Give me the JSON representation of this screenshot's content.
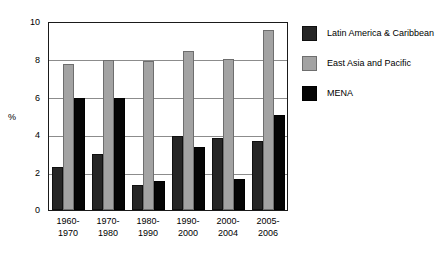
{
  "chart_data": {
    "type": "bar",
    "title": "",
    "xlabel": "",
    "ylabel": "%",
    "ylim": [
      0,
      10
    ],
    "yticks": [
      0,
      2,
      4,
      6,
      8,
      10
    ],
    "grid": true,
    "legend_position": "right",
    "categories": [
      "1960-\n1970",
      "1970-\n1980",
      "1980-\n1990",
      "1990-\n2000",
      "2000-\n2004",
      "2005-\n2006"
    ],
    "category_lines": [
      [
        "1960-",
        "1970"
      ],
      [
        "1970-",
        "1980"
      ],
      [
        "1980-",
        "1990"
      ],
      [
        "1990-",
        "2000"
      ],
      [
        "2000-",
        "2004"
      ],
      [
        "2005-",
        "2006"
      ]
    ],
    "series": [
      {
        "name": "Latin America & Caribbean",
        "color": "#262626",
        "values": [
          2.3,
          3.0,
          1.35,
          3.95,
          3.85,
          3.7
        ]
      },
      {
        "name": "East Asia and Pacific",
        "color": "#a3a3a3",
        "values": [
          7.8,
          8.0,
          7.95,
          8.5,
          8.1,
          9.6
        ]
      },
      {
        "name": "MENA",
        "color": "#050505",
        "values": [
          6.0,
          6.0,
          1.55,
          3.35,
          1.65,
          5.1
        ]
      }
    ]
  },
  "axis": {
    "y_title": "%",
    "y_tick_labels": [
      "10",
      "8",
      "6",
      "4",
      "2",
      "0"
    ]
  },
  "legend": {
    "items": [
      {
        "label": "Latin America & Caribbean"
      },
      {
        "label": "East Asia and Pacific"
      },
      {
        "label": "MENA"
      }
    ]
  }
}
